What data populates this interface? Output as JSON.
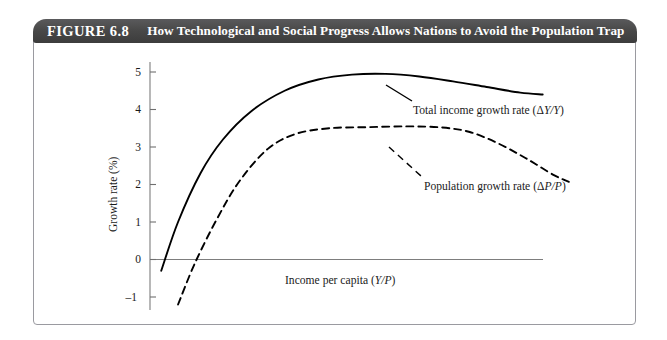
{
  "figure": {
    "number_label": "FIGURE 6.8",
    "title": "How Technological and Social Progress Allows Nations to Avoid the Population Trap",
    "title_bar_color": "#474747",
    "title_text_color": "#ffffff",
    "frame_border_color": "#9a9aa0",
    "background_color": "#ffffff"
  },
  "chart_data": {
    "type": "line",
    "title": "How Technological and Social Progress Allows Nations to Avoid the Population Trap",
    "xlabel": "Income per capita (Y/P)",
    "ylabel": "Growth rate (%)",
    "grid": false,
    "legend_position": "inline-annotations",
    "xlim": [
      0,
      10
    ],
    "ylim": [
      -1.5,
      5.4
    ],
    "x_ticks": [],
    "y_ticks": [
      5,
      4,
      3,
      2,
      1,
      0,
      -1
    ],
    "y_tick_labels": [
      "5",
      "4",
      "3",
      "2",
      "1",
      "0",
      "-1"
    ],
    "axis_line_color": "#808080",
    "series": [
      {
        "name": "Total income growth rate (ΔY/Y)",
        "style": "solid",
        "color": "#000000",
        "x": [
          0.2,
          0.5,
          0.9,
          1.3,
          1.8,
          2.4,
          3.0,
          3.6,
          4.2,
          4.8,
          5.4,
          6.0,
          6.6,
          7.0
        ],
        "y": [
          -0.3,
          1.0,
          2.3,
          3.2,
          3.95,
          4.5,
          4.8,
          4.93,
          4.95,
          4.88,
          4.75,
          4.6,
          4.45,
          4.4
        ]
      },
      {
        "name": "Population growth rate (ΔP/P)",
        "style": "dashed",
        "color": "#000000",
        "x": [
          0.5,
          0.8,
          1.2,
          1.6,
          2.1,
          2.6,
          3.2,
          3.9,
          4.6,
          5.2,
          5.7,
          6.2,
          6.7,
          7.2,
          7.5
        ],
        "y": [
          -1.2,
          -0.1,
          1.1,
          2.1,
          2.95,
          3.35,
          3.5,
          3.53,
          3.55,
          3.52,
          3.4,
          3.1,
          2.7,
          2.25,
          2.05
        ]
      }
    ],
    "annotations": [
      {
        "text": "Total income growth rate (ΔY/Y)",
        "italic_part": "Y/Y",
        "attached_to": "Total income growth rate (ΔY/Y)"
      },
      {
        "text": "Population growth rate (ΔP/P)",
        "italic_part": "P/P",
        "attached_to": "Population growth rate (ΔP/P)"
      },
      {
        "text": "Income per capita (Y/P)",
        "italic_part": "Y/P",
        "attached_to": "x-axis"
      }
    ]
  },
  "labels": {
    "y_axis_title": "Growth rate (%)",
    "x_axis_title_plain": "Income per capita (",
    "x_axis_title_italic": "Y/P",
    "x_axis_title_close": ")",
    "total_income_plain": "Total income growth rate (Δ",
    "total_income_italic": "Y/Y",
    "total_income_close": ")",
    "population_plain": "Population growth rate (Δ",
    "population_italic": "P/P",
    "population_close": ")",
    "y_tick_5": "5",
    "y_tick_4": "4",
    "y_tick_3": "3",
    "y_tick_2": "2",
    "y_tick_1": "1",
    "y_tick_0": "0",
    "y_tick_neg1": "–1"
  }
}
